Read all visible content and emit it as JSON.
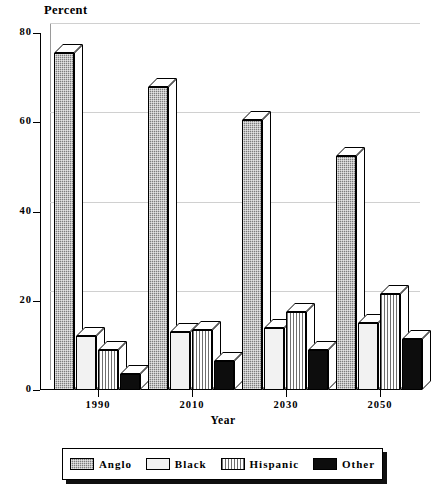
{
  "chart_data": {
    "type": "bar",
    "title": "",
    "ylabel": "Percent",
    "xlabel": "Year",
    "categories": [
      "1990",
      "2010",
      "2030",
      "2050"
    ],
    "ylim": [
      0,
      80
    ],
    "yticks": [
      "0",
      "20",
      "40",
      "60",
      "80"
    ],
    "grid": true,
    "legend_position": "bottom",
    "series": [
      {
        "name": "Anglo",
        "values": [
          75.5,
          68.0,
          60.5,
          52.5
        ],
        "color": "#7d7d7d",
        "pattern": "checkered"
      },
      {
        "name": "Black",
        "values": [
          12.0,
          13.0,
          14.0,
          15.0
        ],
        "color": "#f2f2f2",
        "pattern": "solid-light"
      },
      {
        "name": "Hispanic",
        "values": [
          9.0,
          13.5,
          17.5,
          21.5
        ],
        "color": "#ffffff",
        "pattern": "vertical-stripes"
      },
      {
        "name": "Other",
        "values": [
          3.5,
          6.5,
          9.0,
          11.5
        ],
        "color": "#0d0d0d",
        "pattern": "solid-black"
      }
    ]
  },
  "legend": {
    "items": [
      {
        "label": "Anglo"
      },
      {
        "label": "Black"
      },
      {
        "label": "Hispanic"
      },
      {
        "label": "Other"
      }
    ]
  }
}
